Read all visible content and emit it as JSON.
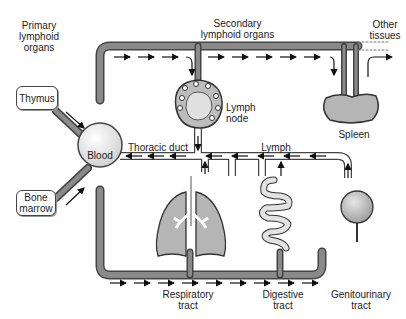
{
  "diagram": {
    "type": "flow-diagram",
    "headings": {
      "primary": "Primary\nlymphoid\norgans",
      "secondary": "Secondary\nlymphoid organs",
      "other": "Other\ntissues"
    },
    "nodes": {
      "thymus": "Thymus",
      "bone_marrow": "Bone\nmarrow",
      "blood": "Blood",
      "lymph_node": "Lymph\nnode",
      "spleen": "Spleen",
      "respiratory": "Respiratory\ntract",
      "digestive": "Digestive\ntract",
      "genitourinary": "Genitourinary\ntract"
    },
    "vessels": {
      "thoracic_duct": "Thoracic duct",
      "lymph": "Lymph"
    },
    "colors": {
      "vessel": "#8a8a8a",
      "vessel_outline": "#444444",
      "organ_fill": "#b8b8b8",
      "arrow": "#111111"
    }
  }
}
